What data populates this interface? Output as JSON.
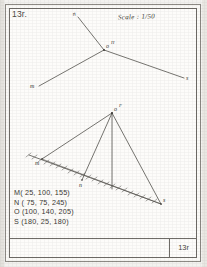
{
  "sheet": {
    "exercise_number_top": "13r.",
    "exercise_number_bottom": "13r",
    "scale_note": "Scale : 1/50"
  },
  "upper_diagram": {
    "name": "plan-projection",
    "labels": {
      "n": "n",
      "o": "o",
      "h": "H",
      "m": "m",
      "s": "s"
    }
  },
  "lower_diagram": {
    "name": "elevation-projection",
    "labels": {
      "o": "o",
      "f": "F",
      "m": "m",
      "n": "n",
      "s": "s"
    }
  },
  "coordinates": {
    "items": [
      "M( 25, 100, 155)",
      "N ( 75, 75, 245)",
      "O (100, 140, 205)",
      "S (180, 25, 180)"
    ]
  },
  "colors": {
    "paper": "#fdfcfa",
    "ink": "#3a3833",
    "frame": "#6f6c67"
  }
}
